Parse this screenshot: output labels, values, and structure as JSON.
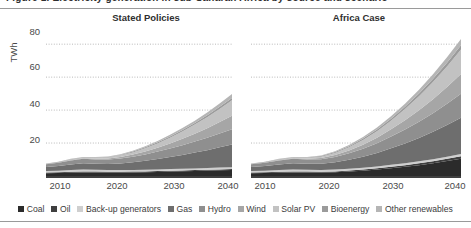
{
  "figure": {
    "clipped_header": "Figure 1.  Electricity generation in sub-Saharan Africa by source and scenario",
    "ylabel": "TWh"
  },
  "panels": [
    {
      "id": "left",
      "title": "Stated Policies"
    },
    {
      "id": "right",
      "title": "Africa Case"
    }
  ],
  "axes": {
    "yticks": [
      "80",
      "60",
      "40",
      "20"
    ],
    "ytick_values": [
      80,
      60,
      40,
      20
    ],
    "xticks": [
      "2010",
      "2020",
      "2030",
      "2040"
    ],
    "ylim": [
      0,
      88
    ],
    "xlim": [
      2010,
      2040
    ],
    "grid": "horizontal-dotted"
  },
  "colors": {
    "coal": "#2b2b2b",
    "oil": "#3f3f3f",
    "backup_generators": "#cfcfcf",
    "gas": "#6e6e6e",
    "hydro": "#8f8f8f",
    "wind": "#a6a6a6",
    "solar_pv": "#c2c2c2",
    "bioenergy": "#9b9b9b",
    "other_renewables": "#b5b5b5",
    "grid_line": "#b9b9b9",
    "axis": "#404040",
    "text": "#3b3b3b"
  },
  "legend": {
    "position": "bottom-center",
    "items": [
      {
        "label": "Coal",
        "color": "#2b2b2b"
      },
      {
        "label": "Oil",
        "color": "#3f3f3f"
      },
      {
        "label": "Back-up generators",
        "color": "#cfcfcf"
      },
      {
        "label": "Gas",
        "color": "#6e6e6e"
      },
      {
        "label": "Hydro",
        "color": "#8f8f8f"
      },
      {
        "label": "Wind",
        "color": "#a6a6a6"
      },
      {
        "label": "Solar PV",
        "color": "#c2c2c2"
      },
      {
        "label": "Bioenergy",
        "color": "#9b9b9b"
      },
      {
        "label": "Other renewables",
        "color": "#b5b5b5"
      }
    ]
  },
  "chart_data": {
    "type": "area",
    "xlabel": "",
    "ylabel": "TWh",
    "ylim": [
      0,
      88
    ],
    "grid": true,
    "legend_position": "bottom",
    "panels": [
      {
        "name": "Stated Policies",
        "x": [
          2010,
          2012,
          2014,
          2016,
          2018,
          2020,
          2022,
          2024,
          2026,
          2028,
          2030,
          2032,
          2034,
          2036,
          2038,
          2040
        ],
        "series": [
          {
            "name": "Coal",
            "color": "#2b2b2b",
            "values": [
              1.6,
              1.8,
              2.0,
              2.2,
              2.2,
              2.1,
              2.1,
              2.2,
              2.3,
              2.5,
              2.7,
              2.9,
              3.1,
              3.3,
              3.5,
              3.7
            ]
          },
          {
            "name": "Oil",
            "color": "#3f3f3f",
            "values": [
              0.5,
              0.5,
              0.6,
              0.6,
              0.5,
              0.5,
              0.5,
              0.5,
              0.5,
              0.5,
              0.5,
              0.5,
              0.5,
              0.5,
              0.5,
              0.5
            ]
          },
          {
            "name": "Back-up generators",
            "color": "#cfcfcf",
            "values": [
              0.9,
              0.9,
              1.0,
              1.1,
              1.1,
              1.1,
              1.0,
              1.0,
              1.0,
              1.0,
              1.0,
              1.0,
              1.0,
              1.0,
              1.1,
              1.1
            ]
          },
          {
            "name": "Gas",
            "color": "#6e6e6e",
            "values": [
              2.4,
              2.8,
              3.4,
              3.8,
              3.6,
              3.6,
              4.0,
              4.6,
              5.4,
              6.3,
              7.3,
              8.4,
              9.6,
              10.9,
              12.3,
              13.8
            ]
          },
          {
            "name": "Hydro",
            "color": "#8f8f8f",
            "values": [
              1.8,
              2.1,
              2.4,
              2.7,
              2.6,
              2.7,
              3.0,
              3.4,
              3.9,
              4.5,
              5.2,
              5.9,
              6.7,
              7.5,
              8.4,
              9.3
            ]
          },
          {
            "name": "Wind",
            "color": "#a6a6a6",
            "values": [
              0.1,
              0.2,
              0.3,
              0.4,
              0.5,
              0.6,
              0.9,
              1.3,
              1.8,
              2.4,
              3.1,
              3.9,
              4.8,
              5.8,
              6.9,
              8.1
            ]
          },
          {
            "name": "Solar PV",
            "color": "#c2c2c2",
            "values": [
              0.0,
              0.1,
              0.2,
              0.3,
              0.4,
              0.6,
              0.9,
              1.3,
              1.9,
              2.6,
              3.4,
              4.4,
              5.5,
              6.7,
              8.0,
              9.4
            ]
          },
          {
            "name": "Bioenergy",
            "color": "#9b9b9b",
            "values": [
              0.2,
              0.2,
              0.3,
              0.3,
              0.3,
              0.4,
              0.4,
              0.5,
              0.6,
              0.7,
              0.8,
              0.9,
              1.0,
              1.1,
              1.3,
              1.4
            ]
          },
          {
            "name": "Other renewables",
            "color": "#b5b5b5",
            "values": [
              0.1,
              0.1,
              0.2,
              0.2,
              0.3,
              0.3,
              0.4,
              0.5,
              0.6,
              0.8,
              1.0,
              1.2,
              1.4,
              1.7,
              2.0,
              2.4
            ]
          }
        ],
        "total_2010": 7.6,
        "total_2040": 49.7
      },
      {
        "name": "Africa Case",
        "x": [
          2010,
          2012,
          2014,
          2016,
          2018,
          2020,
          2022,
          2024,
          2026,
          2028,
          2030,
          2032,
          2034,
          2036,
          2038,
          2040
        ],
        "series": [
          {
            "name": "Coal",
            "color": "#2b2b2b",
            "values": [
              1.6,
              1.8,
              2.0,
              2.2,
              2.2,
              2.1,
              2.3,
              2.7,
              3.2,
              3.9,
              4.7,
              5.6,
              6.6,
              7.8,
              9.1,
              10.5
            ]
          },
          {
            "name": "Oil",
            "color": "#3f3f3f",
            "values": [
              0.5,
              0.5,
              0.6,
              0.6,
              0.5,
              0.5,
              0.5,
              0.6,
              0.7,
              0.8,
              0.9,
              1.0,
              1.1,
              1.2,
              1.3,
              1.5
            ]
          },
          {
            "name": "Back-up generators",
            "color": "#cfcfcf",
            "values": [
              0.9,
              0.9,
              1.0,
              1.1,
              1.1,
              1.1,
              1.1,
              1.1,
              1.1,
              1.1,
              1.2,
              1.2,
              1.2,
              1.2,
              1.3,
              1.3
            ]
          },
          {
            "name": "Gas",
            "color": "#6e6e6e",
            "values": [
              2.4,
              2.8,
              3.4,
              3.8,
              3.6,
              3.7,
              4.4,
              5.4,
              6.7,
              8.2,
              10.0,
              12.0,
              14.2,
              16.6,
              19.2,
              22.0
            ]
          },
          {
            "name": "Hydro",
            "color": "#8f8f8f",
            "values": [
              1.8,
              2.1,
              2.4,
              2.7,
              2.6,
              2.8,
              3.3,
              4.0,
              4.9,
              5.9,
              7.1,
              8.4,
              9.8,
              11.3,
              12.9,
              14.6
            ]
          },
          {
            "name": "Wind",
            "color": "#a6a6a6",
            "values": [
              0.1,
              0.2,
              0.3,
              0.4,
              0.5,
              0.7,
              1.1,
              1.7,
              2.4,
              3.3,
              4.4,
              5.6,
              7.0,
              8.5,
              10.2,
              12.0
            ]
          },
          {
            "name": "Solar PV",
            "color": "#c2c2c2",
            "values": [
              0.0,
              0.1,
              0.2,
              0.3,
              0.5,
              0.8,
              1.3,
              2.0,
              2.9,
              4.0,
              5.3,
              6.8,
              8.5,
              10.4,
              12.5,
              14.8
            ]
          },
          {
            "name": "Bioenergy",
            "color": "#9b9b9b",
            "values": [
              0.2,
              0.2,
              0.3,
              0.3,
              0.3,
              0.4,
              0.5,
              0.6,
              0.8,
              1.0,
              1.2,
              1.4,
              1.7,
              2.0,
              2.3,
              2.6
            ]
          },
          {
            "name": "Other renewables",
            "color": "#b5b5b5",
            "values": [
              0.1,
              0.1,
              0.2,
              0.2,
              0.3,
              0.4,
              0.5,
              0.7,
              0.9,
              1.2,
              1.5,
              1.9,
              2.3,
              2.8,
              3.3,
              3.9
            ]
          }
        ],
        "total_2010": 7.6,
        "total_2040": 83.2
      }
    ]
  }
}
